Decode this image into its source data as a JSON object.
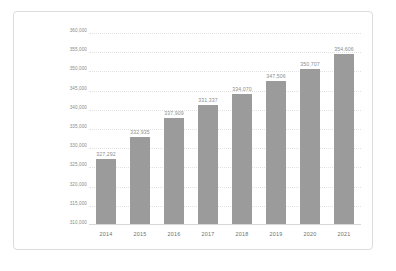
{
  "chart_data": {
    "type": "bar",
    "title": "",
    "subtitle": "",
    "xlabel": "",
    "ylabel": "",
    "categories": [
      "2014",
      "2015",
      "2016",
      "2017",
      "2018",
      "2019",
      "2020",
      "2021"
    ],
    "values": [
      327292,
      332935,
      337909,
      341337,
      344070,
      347506,
      350707,
      354606
    ],
    "data_labels": [
      "327,292",
      "332,935",
      "337,909",
      "331,337",
      "334,070",
      "347,506",
      "350,707",
      "354,606"
    ],
    "ylim": [
      310000,
      360000
    ],
    "ytick_values": [
      360000,
      355000,
      350000,
      345000,
      340000,
      335000,
      330000,
      325000,
      320000,
      315000,
      310000
    ],
    "ytick_labels": [
      "360,000",
      "355,000",
      "350,000",
      "345,000",
      "340,000",
      "335,000",
      "330,000",
      "325,000",
      "320,000",
      "315,000",
      "310,000"
    ],
    "grid": true,
    "legend": false,
    "legend_position": "none",
    "series": [
      {
        "name": "",
        "values": [
          327292,
          332935,
          337909,
          341337,
          344070,
          347506,
          350707,
          354606
        ]
      }
    ]
  },
  "style": {
    "bar_color": "#9b9b9b",
    "gridline_color": "#e3e3e3",
    "axis_color": "#d8d8d8",
    "border_color": "#dcdcdc",
    "label_color": "#8a8a8a",
    "value_color": "#8e8e8e",
    "background": "#ffffff"
  }
}
